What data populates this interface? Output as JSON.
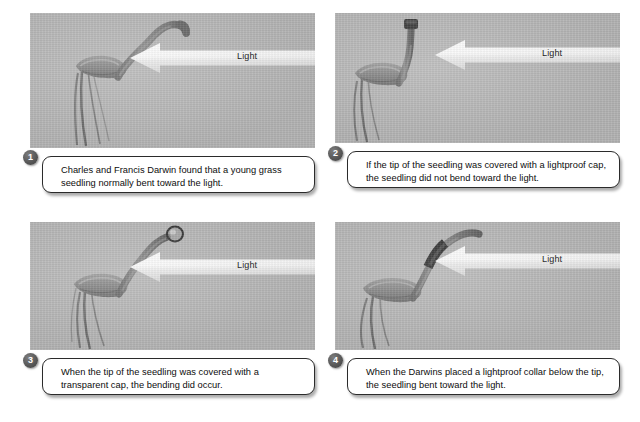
{
  "figure": {
    "background_color": "#ffffff",
    "photo_background_color": "#b9b9b9",
    "badge_color": "#5b5b5b",
    "callout_border_color": "#2b2b2b",
    "arrow_label_color": "#111111"
  },
  "panels": [
    {
      "number": "1",
      "arrow_label": "Light",
      "caption": "Charles and Francis Darwin found that a young grass seedling normally bent toward the light.",
      "seedling": {
        "state": "bent-toward-light",
        "tip_treatment": "none"
      }
    },
    {
      "number": "2",
      "arrow_label": "Light",
      "caption": "If the tip of the seedling was covered with a lightproof cap, the seedling did not bend toward the light.",
      "seedling": {
        "state": "upright-no-bending",
        "tip_treatment": "lightproof-cap"
      }
    },
    {
      "number": "3",
      "arrow_label": "Light",
      "caption": "When the tip of the seedling was covered with a transparent cap, the bending did occur.",
      "seedling": {
        "state": "bent-toward-light",
        "tip_treatment": "transparent-cap"
      }
    },
    {
      "number": "4",
      "arrow_label": "Light",
      "caption": "When the Darwins placed a lightproof collar below the tip, the seedling bent toward the light.",
      "seedling": {
        "state": "bent-toward-light",
        "tip_treatment": "lightproof-collar-below-tip"
      }
    }
  ]
}
